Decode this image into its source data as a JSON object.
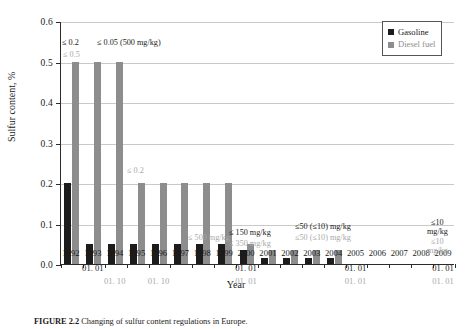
{
  "figure": {
    "caption_label": "FIGURE 2.2",
    "caption_text": "Changing of sulfur content regulations in Europe."
  },
  "legend": {
    "position": "top-right",
    "items": [
      {
        "label": "Gasoline",
        "color": "#1c1c1c",
        "icon": "square-swatch"
      },
      {
        "label": "Diesel fuel",
        "color": "#8d8d8d",
        "icon": "square-swatch"
      }
    ]
  },
  "chart_data": {
    "type": "bar",
    "title": "",
    "xlabel": "Year",
    "ylabel": "Sulfur content, %",
    "ylim": [
      0.0,
      0.6
    ],
    "yticks": [
      "0.0",
      "0.1",
      "0.2",
      "0.3",
      "0.4",
      "0.5",
      "0.6"
    ],
    "ytick_values": [
      0.0,
      0.1,
      0.2,
      0.3,
      0.4,
      0.5,
      0.6
    ],
    "grid": true,
    "legend_position": "upper right",
    "categories": [
      "1992",
      "1993",
      "1994",
      "1995",
      "1996",
      "1997",
      "1998",
      "1999",
      "2000",
      "2001",
      "2002",
      "2003",
      "2004",
      "2005",
      "2006",
      "2007",
      "2008",
      "2009"
    ],
    "series": [
      {
        "name": "Gasoline",
        "color": "#1c1c1c",
        "values": [
          0.2,
          0.05,
          0.05,
          0.05,
          0.05,
          0.05,
          0.05,
          0.05,
          0.035,
          0.015,
          0.015,
          0.015,
          0.015,
          0,
          0,
          0,
          0,
          0
        ]
      },
      {
        "name": "Diesel fuel",
        "color": "#8d8d8d",
        "values": [
          0.5,
          0.5,
          0.5,
          0.2,
          0.2,
          0.2,
          0.2,
          0.2,
          0.05,
          0.035,
          0.035,
          0.035,
          0.035,
          0,
          0,
          0,
          0,
          0
        ]
      }
    ],
    "sub_axis_rows": [
      {
        "style": "black",
        "entries": [
          {
            "category": "1993",
            "text": "01. 01"
          },
          {
            "category": "1996",
            "text": ""
          },
          {
            "category": "2000",
            "text": "01. 01"
          },
          {
            "category": "2005",
            "text": "01. 01"
          },
          {
            "category": "2009",
            "text": "01. 01"
          }
        ]
      },
      {
        "style": "gray",
        "entries": [
          {
            "category": "1994",
            "text": "01. 10"
          },
          {
            "category": "1996",
            "text": "01. 10"
          },
          {
            "category": "2000",
            "text": "01. 01"
          },
          {
            "category": "2005",
            "text": "01. 01"
          },
          {
            "category": "2009",
            "text": "01. 01"
          }
        ]
      }
    ],
    "annotations": [
      {
        "id": "a1",
        "text": "≤ 0.2",
        "style": "black",
        "series": "Gasoline"
      },
      {
        "id": "a2",
        "text": "≤ 0.05 (500 mg/kg)",
        "style": "black",
        "series": "Gasoline"
      },
      {
        "id": "a3",
        "text": "≤ 0.5",
        "style": "gray",
        "series": "Diesel fuel"
      },
      {
        "id": "a4",
        "text": "≤ 0.2",
        "style": "gray",
        "series": "Diesel fuel"
      },
      {
        "id": "a5",
        "text": "≤ 500 mg/kg",
        "style": "gray",
        "series": "Diesel fuel"
      },
      {
        "id": "a6",
        "text": "≤ 150 mg/kg",
        "style": "black",
        "series": "Gasoline"
      },
      {
        "id": "a7",
        "text": "≤ 350 mg/kg",
        "style": "gray",
        "series": "Diesel fuel"
      },
      {
        "id": "a8",
        "text": "≤50 (≤10) mg/kg",
        "style": "black",
        "series": "Gasoline"
      },
      {
        "id": "a9",
        "text": "≤50 (≤10) mg/kg",
        "style": "gray",
        "series": "Diesel fuel"
      },
      {
        "id": "a10",
        "text": "≤10",
        "style": "black",
        "series": "Gasoline"
      },
      {
        "id": "a11",
        "text": "mg/kg",
        "style": "black",
        "series": "Gasoline"
      },
      {
        "id": "a12",
        "text": "≤10",
        "style": "gray",
        "series": "Diesel fuel"
      },
      {
        "id": "a13",
        "text": "mg/kg",
        "style": "gray",
        "series": "Diesel fuel"
      }
    ]
  }
}
